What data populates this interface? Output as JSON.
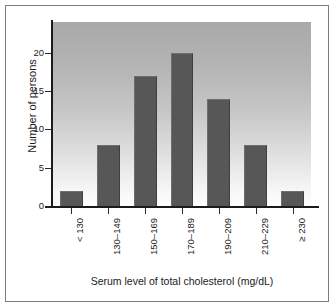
{
  "chart_data": {
    "type": "bar",
    "title": "",
    "subtitle": "",
    "xlabel": "Serum level of total cholesterol (mg/dL)",
    "ylabel": "Number of persons",
    "categories": [
      "< 130",
      "130–149",
      "150–169",
      "170–189",
      "190–209",
      "210–229",
      "≥ 230"
    ],
    "values": [
      2,
      8,
      17,
      20,
      14,
      8,
      2
    ],
    "ylim": [
      0,
      24
    ],
    "yticks": [
      0,
      5,
      10,
      15,
      20
    ],
    "ytick_labels": [
      "0",
      "5",
      "10",
      "15",
      "20"
    ],
    "grid": false,
    "legend": null,
    "legend_position": "none",
    "annotations": [],
    "colors": {
      "bar_fill": "#575757",
      "bar_edge": "#3f3f3f",
      "axis": "#1b1b1b",
      "text": "#1b1b1b",
      "plot_bg_top": "#a9a9a9",
      "plot_bg_bottom": "#fdfdfd",
      "figure_bg": "#ffffff",
      "frame": "#7d7d7d"
    }
  }
}
